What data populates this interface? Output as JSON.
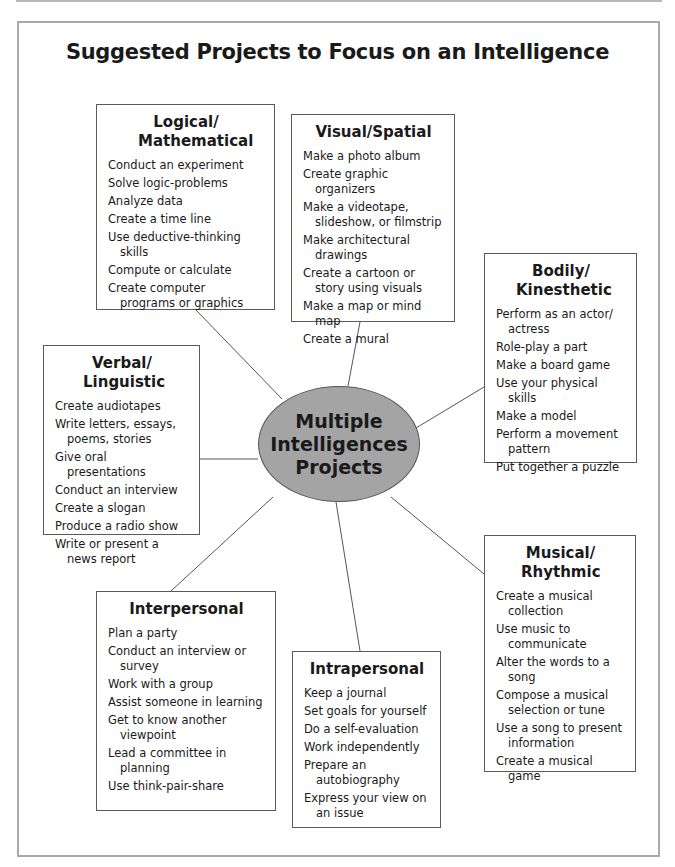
{
  "title": "Suggested Projects to Focus on an Intelligence",
  "hub": {
    "label": "Multiple\nIntelligences\nProjects",
    "fill": "#a4a4a4"
  },
  "boxes": {
    "logical": {
      "heading": "Logical/ Mathematical",
      "items": [
        "Conduct an experiment",
        "Solve logic-problems",
        "Analyze data",
        "Create a time line",
        "Use deductive-thinking skills",
        "Compute or calculate",
        "Create computer programs or graphics"
      ]
    },
    "visual": {
      "heading": "Visual/Spatial",
      "items": [
        "Make a photo album",
        "Create graphic organizers",
        "Make a videotape, slideshow, or filmstrip",
        "Make architectural drawings",
        "Create a cartoon or story using visuals",
        "Make a map or mind map",
        "Create a mural"
      ]
    },
    "bodily": {
      "heading": "Bodily/ Kinesthetic",
      "items": [
        "Perform as an actor/ actress",
        "Role-play a part",
        "Make a board game",
        "Use your physical skills",
        "Make a model",
        "Perform a movement pattern",
        "Put together a puzzle"
      ]
    },
    "verbal": {
      "heading": "Verbal/ Linguistic",
      "items": [
        "Create audiotapes",
        "Write letters, essays, poems, stories",
        "Give oral presentations",
        "Conduct an interview",
        "Create a slogan",
        "Produce a radio show",
        "Write or present a news report"
      ]
    },
    "interpersonal": {
      "heading": "Interpersonal",
      "items": [
        "Plan a party",
        "Conduct an interview or survey",
        "Work with a group",
        "Assist someone in learning",
        "Get to know another viewpoint",
        "Lead a committee in planning",
        "Use think-pair-share"
      ]
    },
    "intrapersonal": {
      "heading": "Intrapersonal",
      "items": [
        "Keep a journal",
        "Set goals for yourself",
        "Do a self-evaluation",
        "Work independently",
        "Prepare an autobiography",
        "Express your view on an issue"
      ]
    },
    "musical": {
      "heading": "Musical/ Rhythmic",
      "items": [
        "Create a musical collection",
        "Use music to communicate",
        "Alter the words to a song",
        "Compose a musical selection or tune",
        "Use a song to present information",
        "Create a musical game"
      ]
    }
  }
}
